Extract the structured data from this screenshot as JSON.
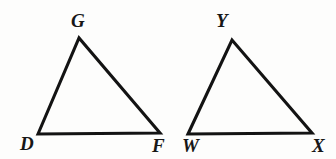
{
  "figure": {
    "type": "geometry-diagram",
    "background_color": "#fdfdfc",
    "stroke_color": "#131313",
    "label_color": "#171717",
    "canvas": {
      "width": 336,
      "height": 159
    },
    "shapes": [
      {
        "name": "triangle-dgf",
        "kind": "triangle",
        "points": "38,134 79,38 160,133",
        "vertices": [
          {
            "label": "D",
            "x": 38,
            "y": 134,
            "label_x": 20,
            "label_y": 134
          },
          {
            "label": "G",
            "x": 79,
            "y": 38,
            "label_x": 71,
            "label_y": 11
          },
          {
            "label": "F",
            "x": 160,
            "y": 133,
            "label_x": 152,
            "label_y": 136
          }
        ]
      },
      {
        "name": "triangle-wyx",
        "kind": "triangle",
        "points": "188,134 232,40 312,133",
        "vertices": [
          {
            "label": "W",
            "x": 188,
            "y": 134,
            "label_x": 182,
            "label_y": 136
          },
          {
            "label": "Y",
            "x": 232,
            "y": 40,
            "label_x": 216,
            "label_y": 11
          },
          {
            "label": "X",
            "x": 312,
            "y": 133,
            "label_x": 312,
            "label_y": 136
          }
        ]
      }
    ]
  }
}
